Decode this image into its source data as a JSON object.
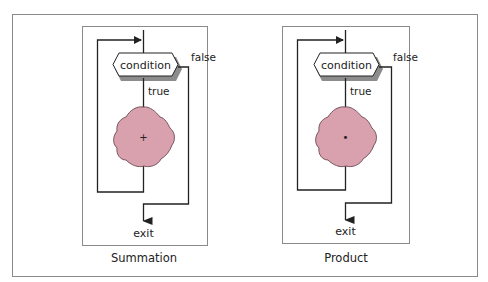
{
  "figure": {
    "colors": {
      "frame": "#8a8a8a",
      "line": "#222222",
      "blob_fill": "#d9a0ae",
      "blob_stroke": "#6a4a52",
      "shadow": "#8c8c8c",
      "text": "#222222"
    },
    "panels": [
      {
        "caption": "Summation",
        "condition_label": "condition",
        "true_label": "true",
        "false_label": "false",
        "exit_label": "exit",
        "operator_mark": "+"
      },
      {
        "caption": "Product",
        "condition_label": "condition",
        "true_label": "true",
        "false_label": "false",
        "exit_label": "exit",
        "operator_mark": "•"
      }
    ]
  }
}
